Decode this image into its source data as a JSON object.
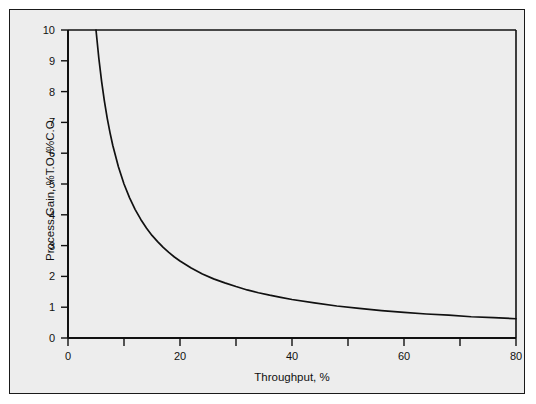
{
  "chart_data": {
    "type": "line",
    "title": "",
    "subtitle": "",
    "xlabel": "Throughput, %",
    "ylabel": "Process Gain, %T.O./%C.O.",
    "xlim": [
      0,
      80
    ],
    "ylim": [
      0,
      10
    ],
    "grid": false,
    "legend": null,
    "legend_position": "none",
    "x_major_ticks": [
      0,
      20,
      40,
      60,
      80
    ],
    "x_minor_ticks": [
      10,
      30,
      50,
      70
    ],
    "x_tick_labels": [
      "0",
      "20",
      "40",
      "60",
      "80"
    ],
    "y_major_ticks": [
      0,
      1,
      2,
      3,
      4,
      5,
      6,
      7,
      8,
      9,
      10
    ],
    "y_tick_labels": [
      "0",
      "1",
      "2",
      "3",
      "4",
      "5",
      "6",
      "7",
      "8",
      "9",
      "10"
    ],
    "relation": "y = 50 / x",
    "series": [
      {
        "name": "Process Gain",
        "color": "#111111",
        "x": [
          5.0,
          5.5,
          6.0,
          6.5,
          7.0,
          7.5,
          8.0,
          9.0,
          10.0,
          11.0,
          12.0,
          13.0,
          14.0,
          15.0,
          16.0,
          17.0,
          18.0,
          19.0,
          20.0,
          22.0,
          24.0,
          26.0,
          28.0,
          30.0,
          32.0,
          34.0,
          36.0,
          38.0,
          40.0,
          44.0,
          48.0,
          52.0,
          56.0,
          60.0,
          64.0,
          68.0,
          72.0,
          76.0,
          80.0
        ],
        "y": [
          10.0,
          9.09,
          8.33,
          7.69,
          7.14,
          6.67,
          6.25,
          5.56,
          5.0,
          4.55,
          4.17,
          3.85,
          3.57,
          3.33,
          3.13,
          2.94,
          2.78,
          2.63,
          2.5,
          2.27,
          2.08,
          1.92,
          1.79,
          1.67,
          1.56,
          1.47,
          1.39,
          1.32,
          1.25,
          1.14,
          1.04,
          0.96,
          0.89,
          0.83,
          0.78,
          0.74,
          0.69,
          0.66,
          0.625
        ]
      }
    ]
  },
  "axes": {
    "x_title": "Throughput, %",
    "y_title": "Process Gain, %T.O./%C.O."
  },
  "style": {
    "panel_background": "#ededed",
    "page_background": "#ffffff",
    "axis_color": "#111111",
    "curve_color": "#111111",
    "frame_color": "#1a1a1a"
  }
}
